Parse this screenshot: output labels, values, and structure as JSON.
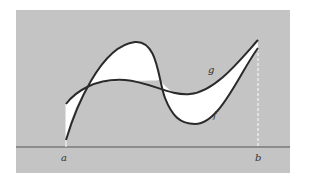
{
  "figure": {
    "background_color": "#c4c4c4",
    "fill_color": "#ffffff",
    "curve_color": "#2a2a2a",
    "labels": {
      "a": "a",
      "b": "b",
      "g": "g",
      "f": "f"
    }
  }
}
